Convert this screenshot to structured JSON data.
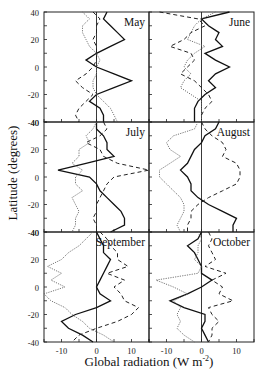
{
  "chart_data": {
    "type": "line",
    "title": "",
    "xlabel": "Global radiation (W m-2)",
    "xlabel_unit_exp": "-2",
    "xlabel_main": "Global radiation (W m",
    "xlabel_tail": ")",
    "ylabel": "Latitude (degrees)",
    "xlim": [
      -15,
      15
    ],
    "ylim": [
      -40,
      40
    ],
    "x_ticks": [
      -10,
      0,
      10
    ],
    "y_ticks": [
      40,
      20,
      0,
      -20,
      -40
    ],
    "grid": false,
    "legend": "none",
    "latitudes": [
      40,
      35,
      30,
      25,
      20,
      15,
      10,
      5,
      0,
      -5,
      -10,
      -15,
      -20,
      -25,
      -30,
      -35,
      -40
    ],
    "panels": [
      {
        "label": "May",
        "series": [
          {
            "name": "solid",
            "values": [
              3,
              2,
              4,
              6,
              8,
              4,
              0,
              -3,
              0,
              5,
              10,
              5,
              0,
              -2,
              1,
              2,
              2
            ]
          },
          {
            "name": "dashed",
            "values": [
              -1,
              1,
              0,
              0,
              -1,
              0,
              0,
              0,
              -1,
              -3,
              -6,
              -4,
              -1,
              -3,
              -5,
              -6,
              -5
            ]
          },
          {
            "name": "dotted",
            "values": [
              -4,
              -2,
              -4,
              -4,
              -3,
              -2,
              0,
              1,
              0,
              0,
              -1,
              -1,
              0,
              2,
              4,
              5,
              6
            ]
          }
        ]
      },
      {
        "label": "June",
        "series": [
          {
            "name": "solid",
            "values": [
              8,
              0,
              2,
              5,
              4,
              6,
              1,
              4,
              8,
              4,
              2,
              4,
              1,
              -1,
              -2,
              -2,
              -2
            ]
          },
          {
            "name": "dashed",
            "values": [
              -12,
              -1,
              1,
              -3,
              -5,
              -9,
              -3,
              -2,
              -4,
              -6,
              -2,
              0,
              2,
              3,
              1,
              0,
              0
            ]
          },
          {
            "name": "dotted",
            "values": [
              4,
              0,
              -2,
              -3,
              -4,
              1,
              -2,
              -4,
              -5,
              -3,
              -5,
              -6,
              -3,
              0,
              0,
              0,
              0
            ]
          }
        ]
      },
      {
        "label": "July",
        "series": [
          {
            "name": "solid",
            "values": [
              0,
              0,
              2,
              3,
              3,
              5,
              -3,
              -11,
              -2,
              0,
              1,
              3,
              5,
              7,
              8,
              8,
              4
            ]
          },
          {
            "name": "dashed",
            "values": [
              2,
              3,
              1,
              -3,
              1,
              2,
              6,
              15,
              5,
              3,
              2,
              1,
              0,
              0,
              -1,
              0,
              0
            ]
          },
          {
            "name": "dotted",
            "values": [
              0,
              -1,
              -3,
              -2,
              -5,
              -5,
              -7,
              -4,
              -6,
              -6,
              -4,
              -7,
              -6,
              -5,
              -6,
              -6,
              -7
            ]
          }
        ]
      },
      {
        "label": "August",
        "series": [
          {
            "name": "solid",
            "values": [
              5,
              4,
              1,
              0,
              -2,
              -3,
              -4,
              -6,
              -4,
              -3,
              -3,
              -1,
              2,
              6,
              10,
              9,
              9
            ]
          },
          {
            "name": "dashed",
            "values": [
              0,
              1,
              3,
              6,
              7,
              6,
              10,
              11,
              11,
              10,
              6,
              2,
              -1,
              -3,
              -3,
              -4,
              -4
            ]
          },
          {
            "name": "dotted",
            "values": [
              -1,
              -2,
              -8,
              -10,
              -9,
              -6,
              -9,
              -12,
              -12,
              -10,
              -8,
              -6,
              -5,
              -5,
              -6,
              -7,
              -6
            ]
          }
        ]
      },
      {
        "label": "September",
        "series": [
          {
            "name": "solid",
            "values": [
              0,
              1,
              2,
              2,
              4,
              3,
              2,
              1,
              0,
              1,
              4,
              0,
              -6,
              -10,
              -8,
              -4,
              -1
            ]
          },
          {
            "name": "dashed",
            "values": [
              1,
              3,
              4,
              6,
              6,
              9,
              3,
              8,
              5,
              7,
              8,
              12,
              10,
              6,
              0,
              -5,
              -7
            ]
          },
          {
            "name": "dotted",
            "values": [
              -1,
              -3,
              -5,
              -8,
              -10,
              -14,
              -10,
              -13,
              -9,
              -15,
              -13,
              -9,
              -7,
              -4,
              -2,
              2,
              5
            ]
          }
        ]
      },
      {
        "label": "October",
        "series": [
          {
            "name": "solid",
            "values": [
              0,
              -1,
              -4,
              -2,
              -1,
              0,
              0,
              3,
              0,
              -4,
              -9,
              -5,
              1,
              1,
              0,
              1,
              2
            ]
          },
          {
            "name": "dashed",
            "values": [
              2,
              3,
              2,
              3,
              4,
              1,
              7,
              3,
              6,
              5,
              9,
              2,
              3,
              5,
              3,
              3,
              2
            ]
          },
          {
            "name": "dotted",
            "values": [
              -1,
              0,
              -1,
              -1,
              -2,
              0,
              -1,
              -13,
              -8,
              -4,
              -8,
              -6,
              -7,
              -6,
              -7,
              -5,
              -2
            ]
          }
        ]
      }
    ]
  }
}
